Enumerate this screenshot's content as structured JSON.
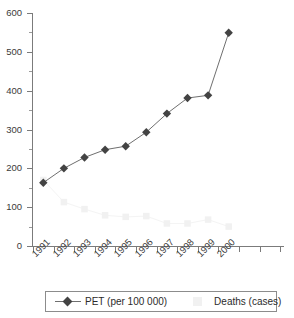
{
  "chart_data": {
    "type": "line",
    "title": "",
    "xlabel": "",
    "ylabel": "",
    "categories": [
      "1991",
      "1992",
      "1993",
      "1994",
      "1995",
      "1996",
      "1997",
      "1998",
      "1999",
      "2000"
    ],
    "ylim": [
      0,
      600
    ],
    "ytick_labels": [
      "0",
      "100",
      "200",
      "300",
      "400",
      "500",
      "600"
    ],
    "ytick_values": [
      0,
      100,
      200,
      300,
      400,
      500,
      600
    ],
    "yminor_step": 50,
    "grid": false,
    "legend_position": "bottom",
    "series": [
      {
        "name": "PET (per 100 000)",
        "marker": "diamond",
        "color": "#434343",
        "line_color": "#6f6f6f",
        "values": [
          163,
          200,
          228,
          248,
          257,
          293,
          341,
          381,
          388,
          549
        ]
      },
      {
        "name": "Deaths (cases)",
        "marker": "square",
        "color": "#f1f1f1",
        "line_color": "#f4f4f4",
        "values": [
          170,
          113,
          95,
          79,
          75,
          77,
          58,
          58,
          68,
          50
        ]
      }
    ]
  },
  "legend": {
    "pet_label": "PET (per 100 000)",
    "deaths_label": "Deaths (cases)"
  },
  "colors": {
    "axis": "#7b7b7b",
    "tick_text": "#3a3a3a",
    "pet_marker": "#434343",
    "pet_line": "#6f6f6f",
    "deaths_marker": "#f1f1f1",
    "legend_border": "#8c8c8c",
    "background": "#ffffff"
  }
}
